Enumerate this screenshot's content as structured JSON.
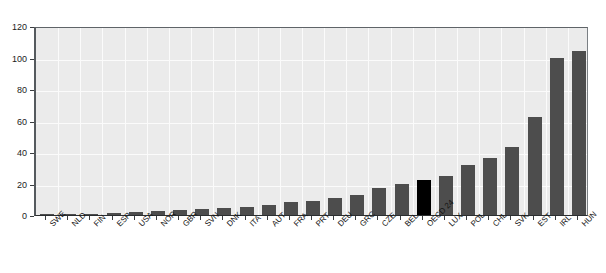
{
  "chart_data": {
    "type": "bar",
    "title": "",
    "subtitle": "",
    "xlabel": "",
    "ylabel": "",
    "ylim": [
      0,
      120
    ],
    "ytick_values": [
      0,
      20,
      40,
      60,
      80,
      100,
      120
    ],
    "ytick_labels": [
      "0",
      "20",
      "40",
      "60",
      "80",
      "100",
      "120"
    ],
    "grid": true,
    "legend": null,
    "bar_color": "#4d4d4d",
    "highlight_color": "#000000",
    "highlight_category": "OECD 24",
    "plot_background": "#ebebeb",
    "categories": [
      "SWE",
      "NLD",
      "FIN",
      "ESP",
      "USA",
      "NOR",
      "GBR",
      "SVN",
      "DNK",
      "ITA",
      "AUT",
      "FRA",
      "PRT",
      "DEU",
      "GRC",
      "CZE",
      "BEL",
      "OECD 24",
      "LUX",
      "POL",
      "CHL",
      "SVK",
      "EST",
      "IRL",
      "HUN"
    ],
    "values": [
      0.3,
      0.5,
      0.8,
      1.2,
      2.0,
      2.4,
      3.0,
      3.6,
      4.6,
      5.4,
      6.6,
      8.0,
      9.0,
      11.0,
      13.0,
      17.0,
      20.0,
      22.0,
      25.0,
      32.0,
      36.0,
      43.0,
      62.0,
      100.0,
      104.0
    ]
  },
  "axes": {
    "y_axis_name": "y-axis",
    "x_axis_name": "x-axis"
  }
}
